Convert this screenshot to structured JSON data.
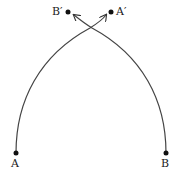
{
  "diagram": {
    "points": [
      {
        "id": "A",
        "label": "A",
        "x": 16,
        "y": 153
      },
      {
        "id": "B",
        "label": "B",
        "x": 166,
        "y": 153
      },
      {
        "id": "B_prime",
        "label": "B′",
        "x": 68,
        "y": 12
      },
      {
        "id": "A_prime",
        "label": "A′",
        "x": 111,
        "y": 12
      }
    ],
    "curves": [
      {
        "from": "A",
        "to": "A_prime",
        "arrow": true
      },
      {
        "from": "B",
        "to": "B_prime",
        "arrow": true
      }
    ],
    "line_color": "#444444"
  }
}
